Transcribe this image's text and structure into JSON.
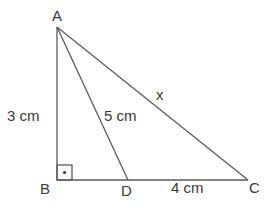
{
  "diagram": {
    "type": "right-triangle",
    "points": {
      "A": {
        "label": "A",
        "x": 57,
        "y": 27
      },
      "B": {
        "label": "B",
        "x": 57,
        "y": 180
      },
      "C": {
        "label": "C",
        "x": 248,
        "y": 180
      },
      "D": {
        "label": "D",
        "x": 128,
        "y": 180
      }
    },
    "segments": [
      {
        "from": "A",
        "to": "B",
        "label": "3 cm"
      },
      {
        "from": "A",
        "to": "D",
        "label": "5 cm"
      },
      {
        "from": "A",
        "to": "C",
        "label": "x"
      },
      {
        "from": "D",
        "to": "C",
        "label": "4 cm"
      },
      {
        "from": "B",
        "to": "D",
        "label": ""
      }
    ],
    "labels": {
      "A": "A",
      "B": "B",
      "C": "C",
      "D": "D",
      "AB": "3 cm",
      "AD": "5 cm",
      "AC": "x",
      "DC": "4 cm"
    },
    "right_angle_at": "B",
    "colors": {
      "line": "#5a5a5a",
      "text": "#3a3a3a",
      "background": "#ffffff"
    }
  }
}
